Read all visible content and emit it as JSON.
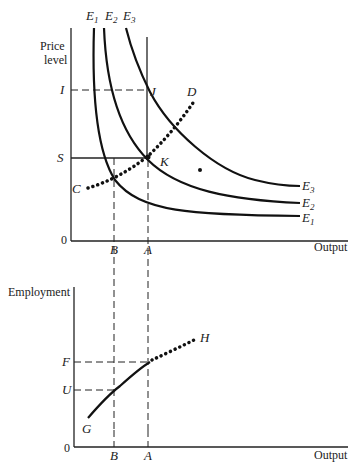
{
  "top_panel": {
    "y_axis_label_line1": "Price",
    "y_axis_label_line2": "level",
    "x_axis_label": "Output",
    "origin": "0",
    "curve_labels_top": [
      "E",
      "E",
      "E"
    ],
    "curve_subscripts_top": [
      "1",
      "2",
      "3"
    ],
    "curve_labels_right": [
      "E",
      "E",
      "E"
    ],
    "curve_subscripts_right": [
      "3",
      "2",
      "1"
    ],
    "y_ticks": [
      "I",
      "S"
    ],
    "x_ticks": [
      "B",
      "A"
    ],
    "points": {
      "J": "J",
      "K": "K",
      "C": "C",
      "D": "D"
    }
  },
  "bottom_panel": {
    "y_axis_label": "Employment",
    "x_axis_label": "Output",
    "origin": "0",
    "y_ticks": [
      "F",
      "U"
    ],
    "x_ticks": [
      "B",
      "A"
    ],
    "points": {
      "G": "G",
      "H": "H"
    }
  }
}
